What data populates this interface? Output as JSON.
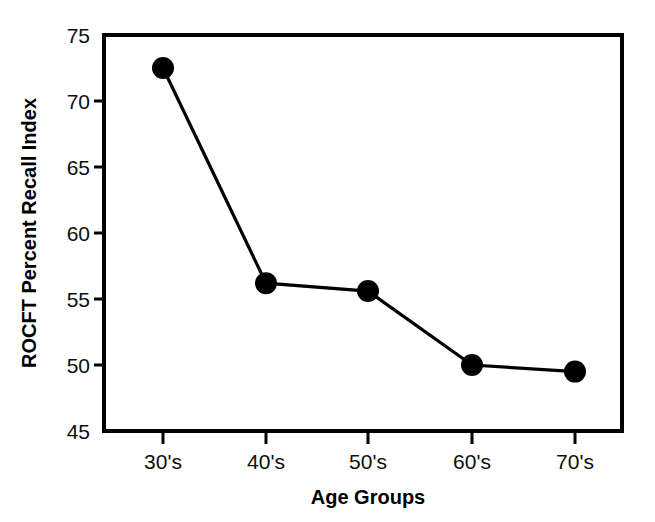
{
  "chart_data": {
    "type": "line",
    "title": "",
    "xlabel": "Age Groups",
    "ylabel": "ROCFT Percent Recall Index",
    "categories": [
      "30's",
      "40's",
      "50's",
      "60's",
      "70's"
    ],
    "values": [
      72.5,
      56.2,
      55.6,
      50.0,
      49.5
    ],
    "series": [
      {
        "name": "ROCFT Percent Recall Index",
        "values": [
          72.5,
          56.2,
          55.6,
          50.0,
          49.5
        ]
      }
    ],
    "ylim": [
      45,
      75
    ],
    "yticks": [
      45,
      50,
      55,
      60,
      65,
      70,
      75
    ],
    "ytick_labels": [
      "45",
      "50",
      "55",
      "60",
      "65",
      "70",
      "75"
    ],
    "xtick_labels": [
      "30's",
      "40's",
      "50's",
      "60's",
      "70's"
    ],
    "grid": false,
    "legend": "none",
    "marker": "filled-circle",
    "line_color": "#000000",
    "marker_color": "#000000",
    "frame_color": "#000000",
    "background_color": "#ffffff"
  },
  "axes": {
    "y_label_text": "ROCFT Percent Recall Index",
    "x_label_text": "Age Groups",
    "y_tick_0": "75",
    "y_tick_1": "70",
    "y_tick_2": "65",
    "y_tick_3": "60",
    "y_tick_4": "55",
    "y_tick_5": "50",
    "y_tick_6": "45",
    "x_tick_0": "30's",
    "x_tick_1": "40's",
    "x_tick_2": "50's",
    "x_tick_3": "60's",
    "x_tick_4": "70's"
  }
}
